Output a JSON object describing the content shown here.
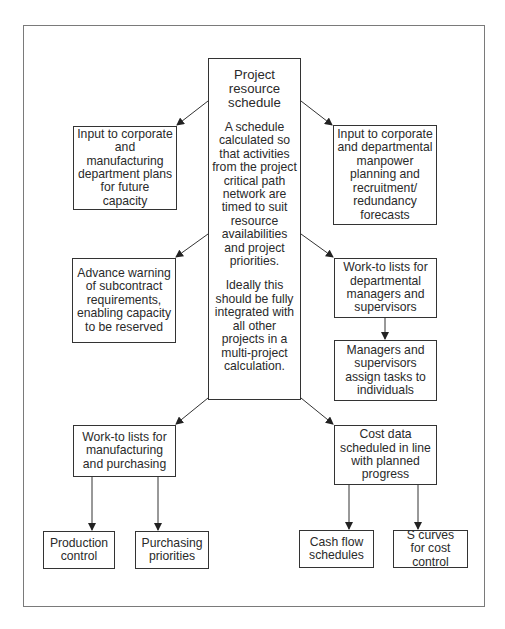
{
  "diagram": {
    "central": {
      "title": "Project resource schedule",
      "description": "A schedule calculated so that activities from the project critical path network are timed to suit resource availabilities and project priorities.",
      "note": "Ideally this should be fully integrated with all other projects in a multi-project calculation."
    },
    "nodes": {
      "corporate_manufacturing": "Input to corporate and manufacturing department plans for future capacity",
      "corporate_manpower": "Input to corporate and departmental manpower planning and recruitment/ redundancy forecasts",
      "subcontract_warning": "Advance warning of subcontract requirements, enabling capacity to be reserved",
      "worklists_departmental": "Work-to lists for departmental managers and supervisors",
      "assign_tasks": "Managers and supervisors assign tasks to individuals",
      "worklists_manufacturing": "Work-to lists for manufacturing and purchasing",
      "cost_data": "Cost data scheduled in line with planned progress",
      "production_control": "Production control",
      "purchasing_priorities": "Purchasing priorities",
      "cash_flow": "Cash flow schedules",
      "s_curves": "S curves for cost control"
    },
    "edges": [
      {
        "from": "central",
        "to": "corporate_manufacturing"
      },
      {
        "from": "central",
        "to": "corporate_manpower"
      },
      {
        "from": "central",
        "to": "subcontract_warning"
      },
      {
        "from": "central",
        "to": "worklists_departmental"
      },
      {
        "from": "worklists_departmental",
        "to": "assign_tasks"
      },
      {
        "from": "central",
        "to": "worklists_manufacturing"
      },
      {
        "from": "central",
        "to": "cost_data"
      },
      {
        "from": "worklists_manufacturing",
        "to": "production_control"
      },
      {
        "from": "worklists_manufacturing",
        "to": "purchasing_priorities"
      },
      {
        "from": "cost_data",
        "to": "cash_flow"
      },
      {
        "from": "cost_data",
        "to": "s_curves"
      }
    ],
    "colors": {
      "line": "#333333",
      "frame": "#7a7a7a",
      "background": "#ffffff"
    }
  }
}
